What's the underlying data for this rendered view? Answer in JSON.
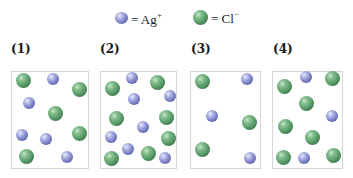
{
  "legend": {
    "ag": {
      "symbol": "= Ag",
      "charge": "+",
      "color": "#7d84c6",
      "icon": "blue-sphere"
    },
    "cl": {
      "symbol": "= Cl",
      "charge": "−",
      "color": "#579a66",
      "icon": "green-sphere"
    }
  },
  "panels": [
    {
      "label": "(1)",
      "box": {
        "x": 11,
        "w": 78
      },
      "atoms": [
        {
          "type": "cl",
          "x": 23,
          "y": 80
        },
        {
          "type": "ag",
          "x": 53,
          "y": 79
        },
        {
          "type": "cl",
          "x": 79,
          "y": 89
        },
        {
          "type": "ag",
          "x": 29,
          "y": 103
        },
        {
          "type": "cl",
          "x": 55,
          "y": 113
        },
        {
          "type": "ag",
          "x": 22,
          "y": 135
        },
        {
          "type": "ag",
          "x": 46,
          "y": 139
        },
        {
          "type": "cl",
          "x": 79,
          "y": 133
        },
        {
          "type": "cl",
          "x": 26,
          "y": 156
        },
        {
          "type": "ag",
          "x": 67,
          "y": 157
        }
      ]
    },
    {
      "label": "(2)",
      "box": {
        "x": 100,
        "w": 77
      },
      "atoms": [
        {
          "type": "cl",
          "x": 112,
          "y": 88
        },
        {
          "type": "ag",
          "x": 132,
          "y": 78
        },
        {
          "type": "cl",
          "x": 157,
          "y": 82
        },
        {
          "type": "ag",
          "x": 134,
          "y": 99
        },
        {
          "type": "ag",
          "x": 170,
          "y": 96
        },
        {
          "type": "cl",
          "x": 116,
          "y": 118
        },
        {
          "type": "ag",
          "x": 143,
          "y": 127
        },
        {
          "type": "cl",
          "x": 166,
          "y": 117
        },
        {
          "type": "ag",
          "x": 111,
          "y": 137
        },
        {
          "type": "cl",
          "x": 168,
          "y": 138
        },
        {
          "type": "ag",
          "x": 128,
          "y": 149
        },
        {
          "type": "cl",
          "x": 111,
          "y": 158
        },
        {
          "type": "cl",
          "x": 148,
          "y": 153
        },
        {
          "type": "ag",
          "x": 165,
          "y": 158
        }
      ]
    },
    {
      "label": "(3)",
      "box": {
        "x": 190,
        "w": 71
      },
      "atoms": [
        {
          "type": "cl",
          "x": 202,
          "y": 81
        },
        {
          "type": "ag",
          "x": 247,
          "y": 79
        },
        {
          "type": "ag",
          "x": 212,
          "y": 116
        },
        {
          "type": "cl",
          "x": 249,
          "y": 122
        },
        {
          "type": "cl",
          "x": 202,
          "y": 149
        },
        {
          "type": "ag",
          "x": 250,
          "y": 158
        }
      ]
    },
    {
      "label": "(4)",
      "box": {
        "x": 272,
        "w": 71
      },
      "atoms": [
        {
          "type": "cl",
          "x": 284,
          "y": 86
        },
        {
          "type": "ag",
          "x": 306,
          "y": 77
        },
        {
          "type": "cl",
          "x": 332,
          "y": 78
        },
        {
          "type": "cl",
          "x": 306,
          "y": 103
        },
        {
          "type": "ag",
          "x": 332,
          "y": 116
        },
        {
          "type": "cl",
          "x": 285,
          "y": 126
        },
        {
          "type": "cl",
          "x": 312,
          "y": 137
        },
        {
          "type": "cl",
          "x": 283,
          "y": 157
        },
        {
          "type": "ag",
          "x": 304,
          "y": 158
        },
        {
          "type": "cl",
          "x": 333,
          "y": 155
        }
      ]
    }
  ]
}
